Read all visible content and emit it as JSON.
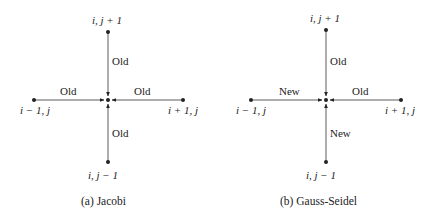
{
  "panels": [
    {
      "caption": "(a) Jacobi",
      "nodes": {
        "top": "i,  j + 1",
        "bottom": "i,  j − 1",
        "left": "i − 1,  j",
        "right": "i + 1,  j"
      },
      "edges": {
        "top": "Old",
        "bottom": "Old",
        "left": "Old",
        "right": "Old"
      }
    },
    {
      "caption": "(b) Gauss-Seidel",
      "nodes": {
        "top": "i,  j + 1",
        "bottom": "i,  j − 1",
        "left": "i − 1,  j",
        "right": "i + 1,  j"
      },
      "edges": {
        "top": "Old",
        "bottom": "New",
        "left": "New",
        "right": "Old"
      }
    }
  ]
}
